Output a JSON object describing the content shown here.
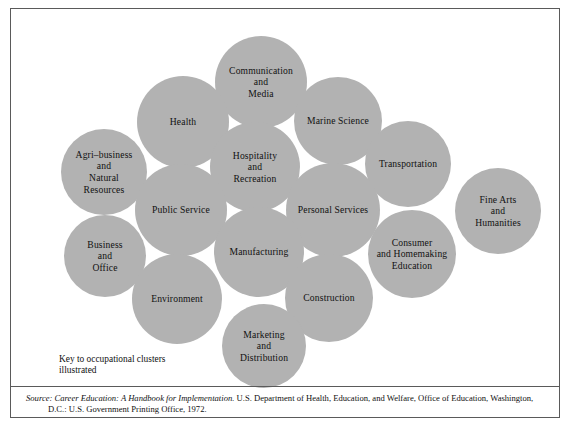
{
  "figure": {
    "key_note": "Key to occupational clusters\nillustrated",
    "bubble_fill": "#b2b2b2",
    "frame_color": "#5a5a5a",
    "text_color": "#111111"
  },
  "source": {
    "lead": "Source:",
    "title": "Career Education:  A Handbook for Implementation.",
    "rest": " U.S. Department of Health, Education, and Welfare, Office of Education, Washington,",
    "line2": "D.C.:  U.S. Government Printing Office, 1972."
  },
  "chart_data": {
    "type": "bubble-cluster-diagram",
    "title": "",
    "note": "Fifteen overlapping equal-size circles each labeled with a USOE occupational cluster",
    "bubbles": [
      {
        "label": "Communication\nand\nMedia",
        "cx": 250,
        "cy": 73,
        "r": 46
      },
      {
        "label": "Health",
        "cx": 172,
        "cy": 113,
        "r": 46
      },
      {
        "label": "Marine Science",
        "cx": 327,
        "cy": 112,
        "r": 44
      },
      {
        "label": "Agri–business\nand\nNatural\nResources",
        "cx": 93,
        "cy": 163,
        "r": 43
      },
      {
        "label": "Hospitality\nand\nRecreation",
        "cx": 244,
        "cy": 158,
        "r": 45
      },
      {
        "label": "Transportation",
        "cx": 397,
        "cy": 155,
        "r": 43
      },
      {
        "label": "Public Service",
        "cx": 170,
        "cy": 201,
        "r": 46
      },
      {
        "label": "Personal Services",
        "cx": 322,
        "cy": 201,
        "r": 47
      },
      {
        "label": "Fine Arts\nand\nHumanities",
        "cx": 487,
        "cy": 202,
        "r": 43
      },
      {
        "label": "Business\nand\nOffice",
        "cx": 94,
        "cy": 247,
        "r": 41
      },
      {
        "label": "Manufacturing",
        "cx": 248,
        "cy": 243,
        "r": 45
      },
      {
        "label": "Consumer\nand Homemaking\nEducation",
        "cx": 401,
        "cy": 245,
        "r": 44
      },
      {
        "label": "Environment",
        "cx": 166,
        "cy": 290,
        "r": 45
      },
      {
        "label": "Construction",
        "cx": 318,
        "cy": 289,
        "r": 44
      },
      {
        "label": "Marketing\nand\nDistribution",
        "cx": 253,
        "cy": 337,
        "r": 42
      }
    ]
  }
}
